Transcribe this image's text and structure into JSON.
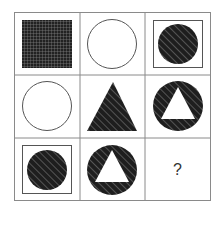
{
  "puzzle": {
    "type": "3x3 matrix reasoning puzzle",
    "rows": 3,
    "cols": 3,
    "cells": [
      {
        "row": 1,
        "col": 1,
        "shape": "square",
        "fill": "crosshatch-grid",
        "frame": false,
        "inner": null
      },
      {
        "row": 1,
        "col": 2,
        "shape": "circle",
        "fill": "white",
        "frame": false,
        "inner": null
      },
      {
        "row": 1,
        "col": 3,
        "shape": "circle",
        "fill": "diagonal-hatch",
        "frame": true,
        "inner": null
      },
      {
        "row": 2,
        "col": 1,
        "shape": "circle",
        "fill": "white",
        "frame": false,
        "inner": null
      },
      {
        "row": 2,
        "col": 2,
        "shape": "triangle",
        "fill": "diagonal-hatch",
        "frame": false,
        "inner": null
      },
      {
        "row": 2,
        "col": 3,
        "shape": "circle",
        "fill": "diagonal-hatch",
        "frame": false,
        "inner": "white-triangle"
      },
      {
        "row": 3,
        "col": 1,
        "shape": "circle",
        "fill": "diagonal-hatch",
        "frame": true,
        "inner": null
      },
      {
        "row": 3,
        "col": 2,
        "shape": "circle",
        "fill": "diagonal-hatch",
        "frame": false,
        "inner": "white-triangle"
      },
      {
        "row": 3,
        "col": 3,
        "shape": "unknown",
        "fill": null,
        "frame": false,
        "inner": null
      }
    ],
    "question_mark": "?"
  },
  "colors": {
    "grid_line": "#888888",
    "shape_dark": "#222222",
    "hatch_light": "#777777",
    "outline": "#555555"
  }
}
